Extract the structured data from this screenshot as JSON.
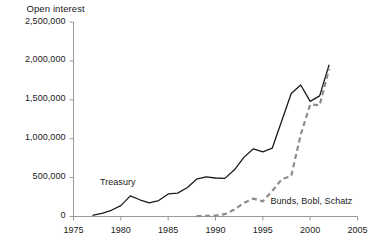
{
  "chart_data": {
    "type": "line",
    "title": "Open interest",
    "xlabel": "",
    "ylabel": "Open interest",
    "xlim": [
      1975,
      2005
    ],
    "ylim": [
      0,
      2500000
    ],
    "grid": false,
    "legend_position": "inline-annotations",
    "x_ticks": [
      "1975",
      "1980",
      "1985",
      "1990",
      "1995",
      "2000",
      "2005"
    ],
    "x_tick_values": [
      1975,
      1980,
      1985,
      1990,
      1995,
      2000,
      2005
    ],
    "y_ticks": [
      "0",
      "500,000",
      "1,000,000",
      "1,500,000",
      "2,000,000",
      "2,500,000"
    ],
    "y_tick_values": [
      0,
      500000,
      1000000,
      1500000,
      2000000,
      2500000
    ],
    "series": [
      {
        "name": "Treasury",
        "style": "solid",
        "color": "#1a1a1a",
        "label_position": {
          "x": 1977.8,
          "y": 430000
        },
        "x": [
          1977,
          1978,
          1979,
          1980,
          1981,
          1982,
          1983,
          1984,
          1985,
          1986,
          1987,
          1988,
          1989,
          1990,
          1991,
          1992,
          1993,
          1994,
          1995,
          1996,
          1997,
          1998,
          1999,
          2000,
          2001,
          2002
        ],
        "values": [
          15000,
          40000,
          80000,
          140000,
          265000,
          215000,
          175000,
          205000,
          290000,
          300000,
          370000,
          480000,
          510000,
          495000,
          490000,
          600000,
          760000,
          870000,
          830000,
          880000,
          1230000,
          1580000,
          1690000,
          1480000,
          1550000,
          1950000
        ]
      },
      {
        "name": "Bunds, Bobl, Schatz",
        "style": "dashed",
        "color": "#8c8c8c",
        "label_position": {
          "x": 1995.8,
          "y": 190000
        },
        "x": [
          1988,
          1989,
          1990,
          1991,
          1992,
          1993,
          1994,
          1995,
          1996,
          1997,
          1998,
          1999,
          2000,
          2001,
          2002
        ],
        "values": [
          5000,
          8000,
          12000,
          30000,
          90000,
          175000,
          230000,
          195000,
          330000,
          480000,
          520000,
          1050000,
          1440000,
          1430000,
          1900000
        ]
      }
    ]
  },
  "axes": {
    "y_axis_title": "Open interest"
  }
}
